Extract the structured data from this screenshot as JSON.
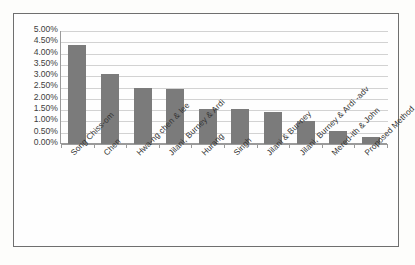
{
  "chart_data": {
    "type": "bar",
    "title": "",
    "subtitle": "",
    "xlabel": "",
    "ylabel": "",
    "ylim": [
      0,
      5
    ],
    "ytick_labels": [
      "5.00%",
      "4.50%",
      "4.00%",
      "3.50%",
      "3.00%",
      "2.50%",
      "2.00%",
      "1.50%",
      "1.00%",
      "0.50%",
      "0.00%"
    ],
    "ytick_values": [
      5.0,
      4.5,
      4.0,
      3.5,
      3.0,
      2.5,
      2.0,
      1.5,
      1.0,
      0.5,
      0.0
    ],
    "grid": true,
    "legend": "none",
    "unit": "%",
    "bar_color": "#7b7b7b",
    "categories": [
      "Song Chiss-om",
      "Chen",
      "Hwa-ng chen & lee",
      "Jilani, Burney & Ardi",
      "Hurang",
      "Singh",
      "Jilani & Bur-ney",
      "Jilani, Burney & Ardi -adv",
      "Mered-ith & John",
      "Proposed Method"
    ],
    "values": [
      4.38,
      3.1,
      2.46,
      2.42,
      1.55,
      1.55,
      1.4,
      1.03,
      0.58,
      0.33
    ],
    "series": [
      {
        "name": "Error Rate",
        "values": [
          4.38,
          3.1,
          2.46,
          2.42,
          1.55,
          1.55,
          1.4,
          1.03,
          0.58,
          0.33
        ]
      }
    ]
  }
}
